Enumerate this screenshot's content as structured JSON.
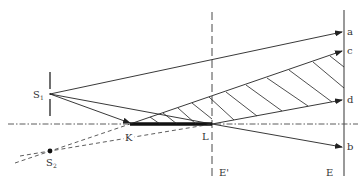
{
  "diagram": {
    "labels": {
      "s1": "S",
      "s1_sub": "1",
      "s2": "S",
      "s2_sub": "2",
      "k": "K",
      "l": "L",
      "e_prime": "E'",
      "e": "E",
      "a": "a",
      "b": "b",
      "c": "c",
      "d": "d"
    },
    "colors": {
      "line": "#222222",
      "background": "#ffffff"
    }
  }
}
